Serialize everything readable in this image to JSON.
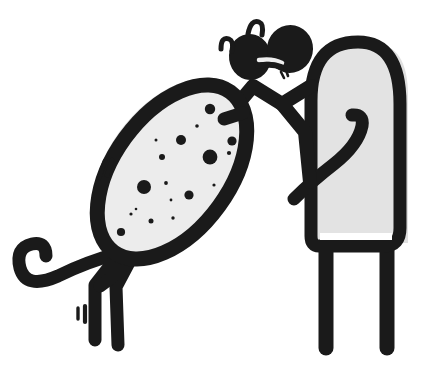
{
  "artwork": {
    "title": "Spotted creature sniffing a tall arched figure",
    "style": "black ink cartoon line drawing",
    "canvas": {
      "width": 435,
      "height": 378,
      "background": "#ffffff"
    },
    "palette": {
      "ink": "#1a1a1a",
      "body_fill": "#ececec",
      "figure_fill": "#e3e3e3",
      "shadow_gray": "#e0e0e0",
      "paper": "#ffffff"
    },
    "subjects": [
      {
        "name": "spotted-creature",
        "label": "Spotted creature",
        "parts": [
          "spotted-oval-body",
          "curled-tail",
          "front-leg",
          "hind-leg-left",
          "hind-leg-right",
          "zigzag-neck",
          "head-blob",
          "snout-blob",
          "antenna-marks",
          "motion-ticks"
        ],
        "spot_count": 18
      },
      {
        "name": "arched-figure",
        "label": "Tall arched figure",
        "parts": [
          "arched-dome-body",
          "hooked-arm",
          "left-leg",
          "right-leg"
        ]
      }
    ],
    "spots": [
      {
        "cx": 210,
        "cy": 109,
        "r": 5.2
      },
      {
        "cx": 197,
        "cy": 126,
        "r": 1.8
      },
      {
        "cx": 181,
        "cy": 140,
        "r": 5.0
      },
      {
        "cx": 232,
        "cy": 141,
        "r": 4.6
      },
      {
        "cx": 162,
        "cy": 157,
        "r": 3.0
      },
      {
        "cx": 210,
        "cy": 157,
        "r": 7.4
      },
      {
        "cx": 229,
        "cy": 153,
        "r": 2.1
      },
      {
        "cx": 166,
        "cy": 183,
        "r": 1.9
      },
      {
        "cx": 144,
        "cy": 187,
        "r": 7.0
      },
      {
        "cx": 189,
        "cy": 195,
        "r": 4.6
      },
      {
        "cx": 214,
        "cy": 185,
        "r": 1.6
      },
      {
        "cx": 131,
        "cy": 214,
        "r": 1.6
      },
      {
        "cx": 151,
        "cy": 221,
        "r": 2.5
      },
      {
        "cx": 173,
        "cy": 218,
        "r": 1.7
      },
      {
        "cx": 121,
        "cy": 232,
        "r": 4.1
      },
      {
        "cx": 171,
        "cy": 200,
        "r": 1.4
      },
      {
        "cx": 136,
        "cy": 209,
        "r": 1.3
      },
      {
        "cx": 156,
        "cy": 140,
        "r": 1.5
      }
    ],
    "marks": {
      "antenna_left": "inverted-v stroke left of head",
      "antenna_right": "inverted-v stroke above head",
      "motion_ticks_body": "two slanted ticks left of the body",
      "motion_ticks_legs": "two short vertical ticks beside the hind legs",
      "mouth_tick": "tiny tick below the snout"
    }
  }
}
